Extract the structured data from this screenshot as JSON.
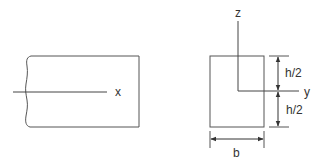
{
  "diagram": {
    "colors": {
      "line": "#555555",
      "text": "#333333",
      "background": "#ffffff"
    },
    "beam_view": {
      "axis_label": "x"
    },
    "cross_section": {
      "z_axis_label": "z",
      "y_axis_label": "y",
      "height_upper_label": "h/2",
      "height_lower_label": "h/2",
      "width_label": "b"
    }
  }
}
